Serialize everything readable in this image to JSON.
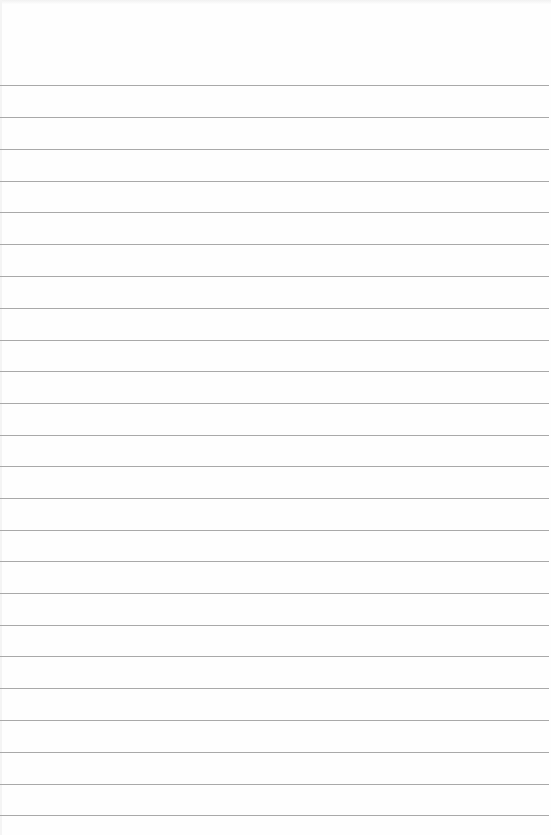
{
  "page": {
    "type": "ruled-paper",
    "background_color": "#fefefe",
    "rule_color": "#a9a9a9",
    "rule_positions_y": [
      85,
      117,
      149,
      181,
      212,
      244,
      276,
      308,
      340,
      371,
      403,
      435,
      466,
      498,
      530,
      561,
      593,
      625,
      656,
      688,
      720,
      752,
      784,
      815
    ],
    "text": ""
  }
}
